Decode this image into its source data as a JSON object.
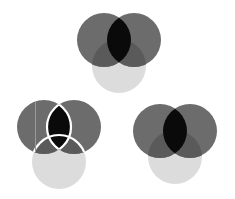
{
  "diagram": {
    "type": "venn-icons",
    "colors": {
      "background": "#ffffff",
      "dark_circle": "#6c6c6c",
      "light_circle": "#dcdcdc",
      "dark_over_light": "#5a5a5a",
      "intersection": "#0a0a0a",
      "outline": "#ffffff"
    },
    "groups": [
      {
        "name": "top",
        "outlined": false,
        "circles": [
          {
            "role": "dark-left",
            "cx": 104,
            "cy": 40,
            "r": 27
          },
          {
            "role": "dark-right",
            "cx": 134,
            "cy": 40,
            "r": 27
          },
          {
            "role": "light-bottom",
            "cx": 119,
            "cy": 66,
            "r": 27
          }
        ]
      },
      {
        "name": "bottom-left",
        "outlined": true,
        "circles": [
          {
            "role": "dark-left",
            "cx": 44,
            "cy": 127,
            "r": 27
          },
          {
            "role": "dark-right",
            "cx": 74,
            "cy": 127,
            "r": 27
          },
          {
            "role": "light-bottom",
            "cx": 59,
            "cy": 162,
            "r": 27
          }
        ]
      },
      {
        "name": "bottom-right",
        "outlined": false,
        "circles": [
          {
            "role": "dark-left",
            "cx": 160,
            "cy": 131,
            "r": 27
          },
          {
            "role": "dark-right",
            "cx": 190,
            "cy": 131,
            "r": 27
          },
          {
            "role": "light-bottom",
            "cx": 175,
            "cy": 157,
            "r": 27
          }
        ]
      }
    ]
  }
}
